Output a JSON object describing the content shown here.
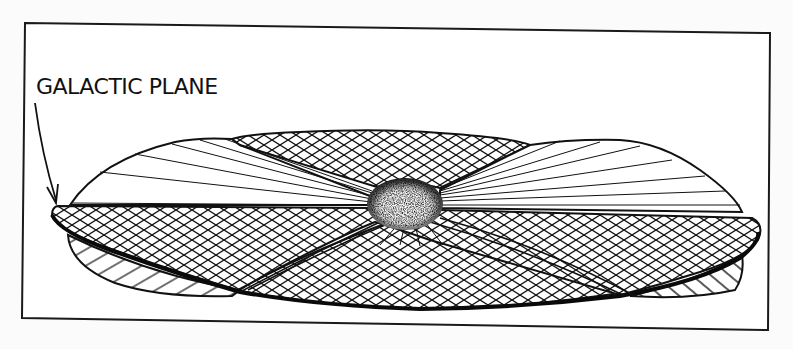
{
  "figure": {
    "labels": {
      "galactic_plane": "GALACTIC PLANE"
    },
    "colors": {
      "background": "#fbfbfb",
      "panel": "#ffffff",
      "ink": "#111111"
    },
    "parts": [
      {
        "name": "galactic-plane-disk",
        "style": "crosshatch"
      },
      {
        "name": "upper-warp-lobe-center",
        "style": "crosshatch"
      },
      {
        "name": "upper-left-lobe",
        "style": "radial-lines"
      },
      {
        "name": "upper-right-lobe",
        "style": "radial-lines"
      },
      {
        "name": "lower-warp-lobe",
        "style": "crosshatch"
      },
      {
        "name": "galactic-bulge",
        "style": "stipple"
      },
      {
        "name": "left-underside-lobe",
        "style": "hatch"
      },
      {
        "name": "right-underside-lobe",
        "style": "hatch"
      }
    ]
  }
}
